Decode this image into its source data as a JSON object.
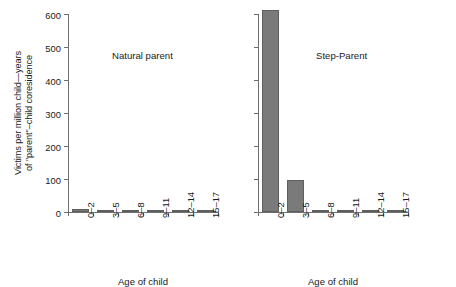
{
  "chart_data": {
    "type": "bar",
    "title": "",
    "xlabel": "Age of child",
    "ylabel": "Victims per million child—years of \"parent\"–child coresidence",
    "ylabel_lines": [
      "Victims per million child—years",
      "of \"parent\"–child coresidence"
    ],
    "categories": [
      "0–2",
      "3–5",
      "6–8",
      "9–11",
      "12–14",
      "15–17"
    ],
    "ylim": [
      0,
      600
    ],
    "yticks": [
      0,
      100,
      200,
      300,
      400,
      500,
      600
    ],
    "ytick_labels": [
      "0",
      "100",
      "200",
      "300",
      "400",
      "500",
      "600"
    ],
    "grid": false,
    "legend": "none",
    "bar_color": "#7a7a7a",
    "axis_color": "#6e6e6e",
    "panels": [
      {
        "name": "natural-parent",
        "title": "Natural parent",
        "show_y_labels": true,
        "values": [
          9,
          6,
          6,
          0.5,
          0.5,
          0.5
        ]
      },
      {
        "name": "step-parent",
        "title": "Step-Parent",
        "show_y_labels": false,
        "values": [
          612,
          96,
          7,
          3,
          3,
          4
        ]
      }
    ]
  }
}
